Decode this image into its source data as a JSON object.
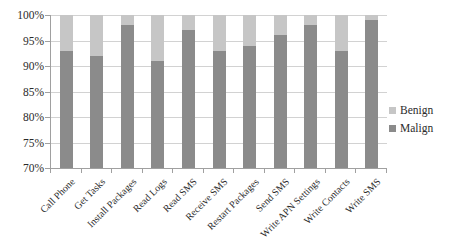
{
  "chart_data": {
    "type": "bar",
    "stacked": true,
    "title": "",
    "xlabel": "",
    "ylabel": "",
    "categories": [
      "Call Phone",
      "Get Tasks",
      "Install Packages",
      "Read Logs",
      "Read SMS",
      "Receive SMS",
      "Restart Packages",
      "Send SMS",
      "Write APN Settings",
      "Write Contacts",
      "Write SMS"
    ],
    "series": [
      {
        "name": "Malign",
        "color": "#8b8b8b",
        "values": [
          93,
          92,
          98,
          91,
          97,
          93,
          94,
          96,
          98,
          93,
          99
        ]
      },
      {
        "name": "Benign",
        "color": "#c6c6c6",
        "values": [
          7,
          8,
          2,
          9,
          3,
          7,
          6,
          4,
          2,
          7,
          1
        ]
      }
    ],
    "y_axis": {
      "min": 70,
      "max": 100,
      "step": 5,
      "tick_labels": [
        "70%",
        "75%",
        "80%",
        "85%",
        "90%",
        "95%",
        "100%"
      ]
    },
    "grid": true,
    "legend": {
      "position": "right",
      "entries": [
        {
          "label": "Benign",
          "color": "#c6c6c6"
        },
        {
          "label": "Malign",
          "color": "#8b8b8b"
        }
      ]
    },
    "colors": {
      "background": "#ffffff",
      "gridline": "#d2d2d2",
      "axis": "#a0a0a0",
      "text": "#2b2b2b"
    }
  }
}
